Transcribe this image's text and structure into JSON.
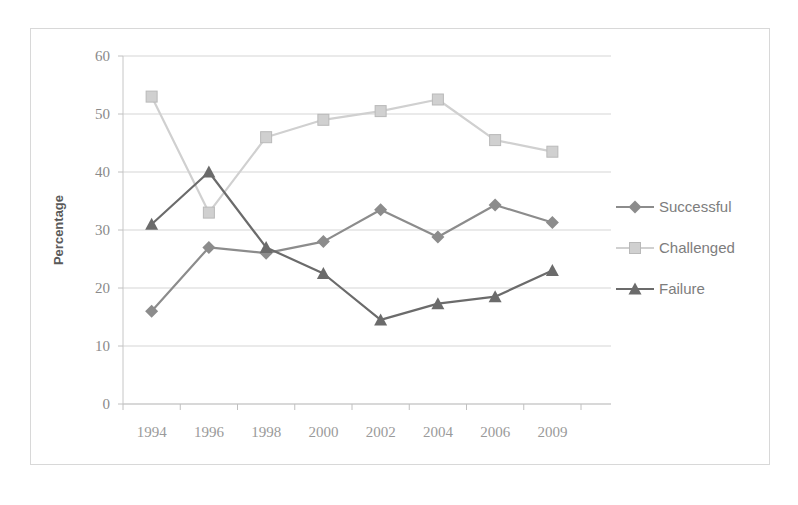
{
  "chart_data": {
    "type": "line",
    "title": "",
    "xlabel": "",
    "ylabel": "Percentage",
    "categories": [
      "1994",
      "1996",
      "1998",
      "2000",
      "2002",
      "2004",
      "2006",
      "2009"
    ],
    "ylim": [
      0,
      60
    ],
    "ytick_values": [
      0,
      10,
      20,
      30,
      40,
      50,
      60
    ],
    "ytick_labels": [
      "0",
      "10",
      "20",
      "30",
      "40",
      "50",
      "60"
    ],
    "grid": true,
    "legend_position": "right",
    "series": [
      {
        "name": "Successful",
        "marker": "diamond",
        "color": "#8c8c8c",
        "values": [
          16.0,
          27.0,
          26.0,
          28.0,
          33.5,
          28.8,
          34.3,
          31.3
        ]
      },
      {
        "name": "Challenged",
        "marker": "square",
        "color": "#d0d0d0",
        "values": [
          53.0,
          33.0,
          46.0,
          49.0,
          50.5,
          52.5,
          45.5,
          43.5
        ]
      },
      {
        "name": "Failure",
        "marker": "triangle",
        "color": "#6b6b6b",
        "values": [
          31.0,
          40.0,
          27.0,
          22.5,
          14.5,
          17.3,
          18.5,
          23.0
        ]
      }
    ]
  },
  "legend": {
    "items": [
      {
        "label": "Successful"
      },
      {
        "label": "Challenged"
      },
      {
        "label": "Failure"
      }
    ]
  },
  "axes": {
    "y_title": "Percentage"
  },
  "colors": {
    "successful": "#8c8c8c",
    "challenged": "#d0d0d0",
    "failure": "#6b6b6b",
    "grid": "#d5d5d5",
    "axis": "#c6c6c6",
    "frame_border": "#d8d8d8",
    "tick_text": "#8a8a8a",
    "legend_text": "#7d7d7d"
  }
}
